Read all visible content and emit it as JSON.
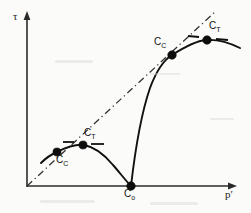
{
  "figure": {
    "background_color": "#fbfbfa",
    "ink_color": "#111111"
  },
  "axes": {
    "y_label": "τ",
    "x_label": "p′",
    "origin": {
      "x": 27,
      "y": 186
    },
    "y_axis_top": {
      "x": 27,
      "y": 14
    },
    "x_axis_right": {
      "x": 236,
      "y": 186
    }
  },
  "reference_line": {
    "name": "critical-state-line",
    "style": "dash-dot",
    "from": {
      "x": 27,
      "y": 186
    },
    "to": {
      "x": 216,
      "y": 11
    }
  },
  "points": [
    {
      "id": "cc-small",
      "label": "C",
      "subscript": "C",
      "x": 57,
      "y": 152,
      "label_x": 57,
      "label_y": 155
    },
    {
      "id": "ct-small",
      "label": "C",
      "subscript": "T",
      "x": 82,
      "y": 145,
      "label_x": 84,
      "label_y": 129
    },
    {
      "id": "co",
      "label": "C",
      "subscript": "o",
      "x": 131,
      "y": 186,
      "label_x": 125,
      "label_y": 190
    },
    {
      "id": "cc-large",
      "label": "C",
      "subscript": "C",
      "x": 172,
      "y": 55,
      "label_x": 155,
      "label_y": 38
    },
    {
      "id": "ct-large",
      "label": "C",
      "subscript": "T",
      "x": 208,
      "y": 40,
      "label_x": 210,
      "label_y": 22
    }
  ],
  "curves": [
    {
      "id": "small-envelope",
      "name": "inner-yield-envelope",
      "path": "M 41 163 C 47 157 52 154 57 152 C 67 147 76 144 84 145 C 95 147 104 154 113 165 C 120 173 126 181 131 186"
    },
    {
      "id": "large-envelope",
      "name": "outer-yield-envelope",
      "path": "M 131 186 C 134 160 139 120 150 88 C 157 69 164 60 172 55 C 183 48 195 41 206 40 C 218 39 230 43 240 48"
    }
  ],
  "tick_marks": [
    {
      "id": "tick-small-left",
      "x1": 63,
      "y1": 142,
      "x2": 74,
      "y2": 142
    },
    {
      "id": "tick-small-right",
      "x1": 91,
      "y1": 144,
      "x2": 104,
      "y2": 144
    },
    {
      "id": "tick-large-left",
      "x1": 188,
      "y1": 36,
      "x2": 199,
      "y2": 37
    },
    {
      "id": "tick-large-right",
      "x1": 216,
      "y1": 39,
      "x2": 228,
      "y2": 40
    }
  ],
  "chart_data": {
    "type": "line",
    "title": "",
    "xlabel": "p′",
    "ylabel": "τ",
    "grid": false,
    "legend": "none",
    "annotations": [
      "C_C (inner curve)",
      "C_T (inner curve)",
      "C_o (origin of curves on p′ axis)",
      "C_C (outer curve)",
      "C_T (outer curve)"
    ],
    "series": [
      {
        "name": "inner-yield-envelope",
        "x": [
          41,
          50,
          57,
          66,
          75,
          84,
          95,
          106,
          117,
          126,
          131
        ],
        "y": [
          163,
          155,
          152,
          148,
          145,
          145,
          148,
          156,
          168,
          179,
          186
        ]
      },
      {
        "name": "outer-yield-envelope",
        "x": [
          131,
          137,
          146,
          157,
          165,
          172,
          183,
          194,
          206,
          220,
          240
        ],
        "y": [
          186,
          152,
          112,
          80,
          64,
          55,
          48,
          43,
          40,
          41,
          48
        ]
      },
      {
        "name": "critical-state-line",
        "x": [
          27,
          216
        ],
        "y": [
          186,
          11
        ]
      }
    ]
  }
}
